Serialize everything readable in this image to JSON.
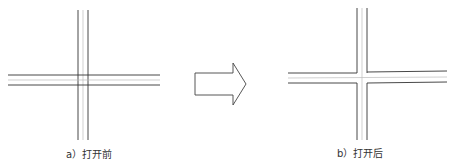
{
  "figure_a": {
    "caption": "a）打开前",
    "state": "before-trim"
  },
  "figure_b": {
    "caption": "b）打开后",
    "state": "after-trim"
  },
  "arrow": {
    "direction": "right"
  },
  "colors": {
    "line": "#333333",
    "centerline": "#bbbbbb",
    "arrow_stroke": "#444444"
  }
}
